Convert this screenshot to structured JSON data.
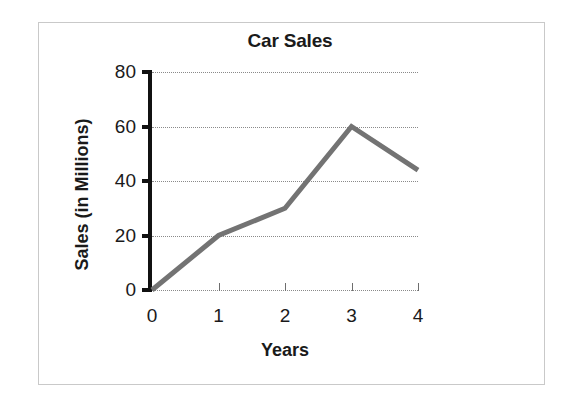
{
  "chart_data": {
    "type": "line",
    "title": "Car Sales",
    "xlabel": "Years",
    "ylabel": "Sales (in Millions)",
    "x": [
      0,
      1,
      2,
      3,
      4
    ],
    "values": [
      0,
      20,
      30,
      60,
      44
    ],
    "series": [
      {
        "name": "Car Sales",
        "values": [
          0,
          20,
          30,
          60,
          44
        ]
      }
    ],
    "xtick_labels": [
      "0",
      "1",
      "2",
      "3",
      "4"
    ],
    "ytick_labels": [
      "0",
      "20",
      "40",
      "60",
      "80"
    ],
    "xlim": [
      0,
      4
    ],
    "ylim": [
      0,
      80
    ],
    "grid": "horizontal-dotted",
    "legend": "none",
    "line_color": "#737373",
    "axis_color": "#111111",
    "gridline_color": "#8a8a8a",
    "frame_color": "#c9c9c9",
    "background": "#ffffff"
  }
}
